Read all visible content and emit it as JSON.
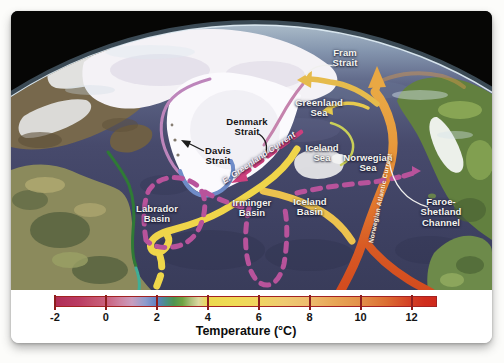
{
  "map_labels": [
    {
      "id": "fram-strait",
      "text": "Fram\nStrait"
    },
    {
      "id": "greenland-sea",
      "text": "Greenland\nSea"
    },
    {
      "id": "denmark-strait",
      "text": "Denmark\nStrait"
    },
    {
      "id": "davis-strait",
      "text": "Davis\nStrait"
    },
    {
      "id": "iceland-sea",
      "text": "Iceland\nSea"
    },
    {
      "id": "norwegian-sea",
      "text": "Norwegian\nSea"
    },
    {
      "id": "east-greenland-current",
      "text": "E. Greenland Current"
    },
    {
      "id": "labrador-basin",
      "text": "Labrador\nBasin"
    },
    {
      "id": "irminger-basin",
      "text": "Irminger\nBasin"
    },
    {
      "id": "iceland-basin",
      "text": "Iceland\nBasin"
    },
    {
      "id": "norwegian-atlantic-current",
      "text": "Norwegian Atlantic Current"
    },
    {
      "id": "faroe-shetland-channel",
      "text": "Faroe-Shetland\nChannel"
    }
  ],
  "current_colors": {
    "warm_orange_current": "#e07c2e",
    "yellow_current": "#efd54a",
    "magenta_dashed_overflow": "#b8539b",
    "pink_dashed_east_greenland": "#cc3f7d",
    "blue_current": "#6f8cc8",
    "purple_west_greenland": "#bd85bb",
    "green_labrador": "#2f7a36",
    "teal_segment": "#3fae96"
  },
  "colorbar": {
    "title": "Temperature (°C)",
    "range_c": [
      -2,
      13
    ],
    "ticks": [
      {
        "label": "-2",
        "pct": 0
      },
      {
        "label": "0",
        "pct": 13.33
      },
      {
        "label": "2",
        "pct": 26.67
      },
      {
        "label": "4",
        "pct": 40
      },
      {
        "label": "6",
        "pct": 53.33
      },
      {
        "label": "8",
        "pct": 66.67
      },
      {
        "label": "10",
        "pct": 80
      },
      {
        "label": "12",
        "pct": 93.33
      }
    ],
    "gradient": [
      {
        "pct": 0,
        "color": "#b02e57"
      },
      {
        "pct": 6,
        "color": "#ba3c63"
      },
      {
        "pct": 10,
        "color": "#c4536f"
      },
      {
        "pct": 13.3,
        "color": "#c9607e"
      },
      {
        "pct": 17,
        "color": "#cd84a2"
      },
      {
        "pct": 20,
        "color": "#c99dbe"
      },
      {
        "pct": 23.5,
        "color": "#8f9ccc"
      },
      {
        "pct": 26.7,
        "color": "#5c7fc2"
      },
      {
        "pct": 29,
        "color": "#4b8f84"
      },
      {
        "pct": 31,
        "color": "#4f9350"
      },
      {
        "pct": 33.3,
        "color": "#6fa343"
      },
      {
        "pct": 35.5,
        "color": "#aebf7a"
      },
      {
        "pct": 37.5,
        "color": "#dcd7a0"
      },
      {
        "pct": 40,
        "color": "#ecd94e"
      },
      {
        "pct": 47,
        "color": "#f0da55"
      },
      {
        "pct": 53.3,
        "color": "#f0d561"
      },
      {
        "pct": 60,
        "color": "#efca71"
      },
      {
        "pct": 66.7,
        "color": "#edbb6e"
      },
      {
        "pct": 73.3,
        "color": "#e8a656"
      },
      {
        "pct": 80,
        "color": "#e3914a"
      },
      {
        "pct": 86.7,
        "color": "#dc6f33"
      },
      {
        "pct": 93.3,
        "color": "#d43f25"
      },
      {
        "pct": 97,
        "color": "#d02d1d"
      },
      {
        "pct": 100,
        "color": "#cf291c"
      }
    ]
  }
}
